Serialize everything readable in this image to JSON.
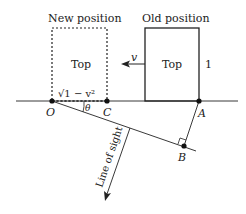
{
  "labels": {
    "new_position": "New position",
    "old_position": "Old position",
    "top_new": "Top",
    "top_old": "Top",
    "velocity": "v",
    "height": "1",
    "sqrt_expr": "√1 − v²",
    "theta": "θ",
    "point_o": "O",
    "point_c": "C",
    "point_a": "A",
    "point_b": "B",
    "line_of_sight": "Line of sight"
  },
  "colors": {
    "stroke": "#222222",
    "background": "#ffffff"
  }
}
